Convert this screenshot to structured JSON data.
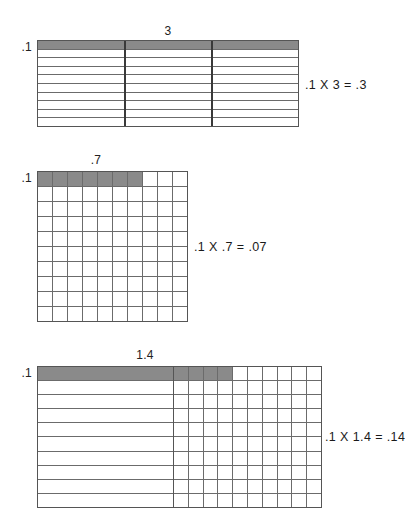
{
  "page": {
    "shade_color": "#8a8a8a",
    "line_color": "#6b6b6b",
    "frame_color": "#555555"
  },
  "diagrams": [
    {
      "id": "diagram-1",
      "top_label": "3",
      "side_label": ".1",
      "equation": ".1 X 3 = .3",
      "columns_total": 3,
      "rows_total": 10,
      "shaded_rows": 1,
      "shaded_columns": 3,
      "cells_per_unit": 1,
      "model": "three whole units, top tenth row shaded"
    },
    {
      "id": "diagram-2",
      "top_label": ".7",
      "side_label": ".1",
      "equation": ".1 X .7 = .07",
      "columns_total": 10,
      "rows_total": 10,
      "shaded_rows": 1,
      "shaded_columns": 7,
      "cells_per_unit": 10,
      "model": "one unit square, 7 of 100 cells shaded"
    },
    {
      "id": "diagram-3",
      "top_label": "1.4",
      "side_label": ".1",
      "equation": ".1 X 1.4 = .14",
      "columns_total": 10,
      "rows_total": 10,
      "shaded_rows": 1,
      "shaded_columns": 4,
      "whole_units": 1,
      "model": "one whole unit plus 4 of 10 columns, top tenth row shaded"
    }
  ]
}
